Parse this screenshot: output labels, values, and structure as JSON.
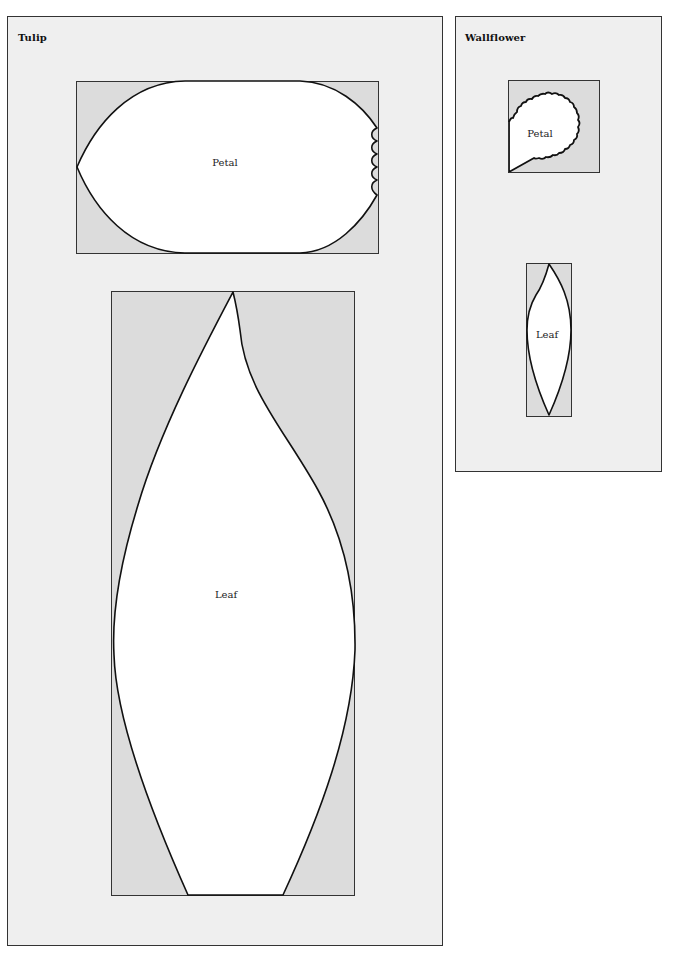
{
  "colors": {
    "page_background": "#ffffff",
    "panel_background": "#efefef",
    "template_box_fill": "#dcdcdc",
    "shape_fill": "#ffffff",
    "outline": "#111111"
  },
  "panels": [
    {
      "id": "tulip",
      "title": "Tulip",
      "shapes": [
        {
          "id": "tulip-petal",
          "label": "Petal"
        },
        {
          "id": "tulip-leaf",
          "label": "Leaf"
        }
      ]
    },
    {
      "id": "wallflower",
      "title": "Wallflower",
      "shapes": [
        {
          "id": "wallflower-petal",
          "label": "Petal"
        },
        {
          "id": "wallflower-leaf",
          "label": "Leaf"
        }
      ]
    }
  ]
}
